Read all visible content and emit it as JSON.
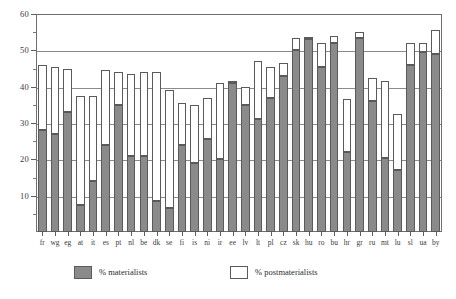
{
  "chart_data": {
    "type": "bar",
    "stacked": true,
    "title": "",
    "subtitle": "",
    "xlabel": "",
    "ylabel": "",
    "ylim": [
      0,
      60
    ],
    "yticks": [
      10,
      20,
      30,
      40,
      50,
      60
    ],
    "yticks_minor": [
      5,
      15,
      25,
      35,
      45,
      55
    ],
    "ytick_labels": [
      "10",
      "20",
      "30",
      "40",
      "50",
      "60"
    ],
    "grid": true,
    "legend_position": "bottom",
    "categories": [
      "fr",
      "wg",
      "eg",
      "at",
      "it",
      "es",
      "pt",
      "nl",
      "be",
      "dk",
      "se",
      "fi",
      "is",
      "ni",
      "ir",
      "ee",
      "lv",
      "lt",
      "pl",
      "cz",
      "sk",
      "hu",
      "ro",
      "bu",
      "hr",
      "gr",
      "ru",
      "mt",
      "lu",
      "sl",
      "ua",
      "by"
    ],
    "series": [
      {
        "name": "% materialists",
        "color": "#8a8a8a",
        "values": [
          28,
          27,
          33,
          7.5,
          14,
          24,
          35,
          21,
          21,
          8.5,
          6.5,
          24,
          19,
          25.5,
          20,
          41,
          35,
          31,
          37,
          43,
          50,
          53,
          45.5,
          52,
          22,
          53.5,
          36,
          20.5,
          17,
          46,
          49.5,
          49
        ]
      },
      {
        "name": "% postmaterialists",
        "color": "#ffffff",
        "values": [
          18,
          18.5,
          12,
          30,
          23.5,
          20.5,
          9,
          22.5,
          23,
          35.5,
          32.5,
          11.5,
          16,
          11.5,
          21,
          0.5,
          5,
          16,
          8.5,
          3.5,
          3.5,
          0.8,
          6.5,
          2,
          14.5,
          1.5,
          6.5,
          21,
          15.5,
          6,
          2.5,
          6.5
        ]
      }
    ],
    "totals": [
      46,
      45.5,
      45,
      37.5,
      37.5,
      44.5,
      44,
      43.5,
      44,
      44,
      39,
      35.5,
      35,
      37,
      41,
      41.5,
      40,
      47,
      45.5,
      46.5,
      53.5,
      53.8,
      52,
      54,
      36.5,
      55,
      42.5,
      41.5,
      32.5,
      52,
      52,
      55.5
    ]
  },
  "legend": {
    "materialists_label": "% materialists",
    "postmaterialists_label": "% postmaterialists"
  }
}
